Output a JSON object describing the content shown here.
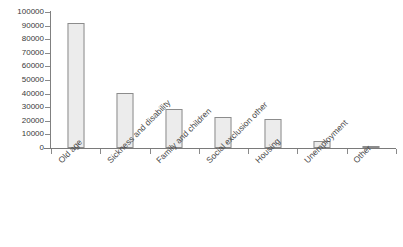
{
  "chart_data": {
    "type": "bar",
    "title": "",
    "subtitle": "",
    "xlabel": "",
    "ylabel": "",
    "categories": [
      "Old age",
      "Sickness and disability",
      "Family and children",
      "Social exclusion other",
      "Housing",
      "Unemployment",
      "Other"
    ],
    "values": [
      92000,
      40500,
      28500,
      23000,
      21000,
      5000,
      1800
    ],
    "ylim": [
      0,
      100000
    ],
    "ytick_labels": [
      "100000",
      "90000",
      "80000",
      "70000",
      "60000",
      "50000",
      "40000",
      "30000",
      "20000",
      "10000",
      "0"
    ],
    "ytick_values": [
      100000,
      90000,
      80000,
      70000,
      60000,
      50000,
      40000,
      30000,
      20000,
      10000,
      0
    ],
    "grid": false,
    "legend": null,
    "legend_position": "none",
    "bar_fill_color": "#ececec",
    "bar_border_color": "#8c8c8c",
    "axis_color": "#808080",
    "text_color": "#3a3a3a",
    "background_color": "#ffffff",
    "xlabel_rotation_deg": -45
  }
}
